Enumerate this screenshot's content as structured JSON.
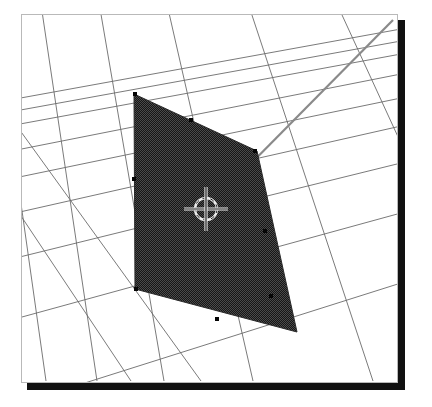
{
  "app": {
    "title": "3D Viewport",
    "view_mode": "Perspective",
    "shading": "Solid"
  },
  "viewport": {
    "name": "3d-viewport",
    "width": 377,
    "height": 369,
    "x": 21,
    "y": 14,
    "background_color": "#ffffff",
    "border_color": "#b9b9b9",
    "shadow_color": "#111111",
    "shadow_offset_x": 6,
    "shadow_offset_y": 6
  },
  "scene": {
    "grid": {
      "name": "perspective-floor-grid",
      "line_color": "#6b6b6b",
      "line_width": 0.9,
      "description": "Perspective ground plane grid with two families of converging lines",
      "family_a_label": "grid-lines-receding",
      "family_b_label": "grid-lines-lateral",
      "family_a": [
        [
          [
            -30,
            132
          ],
          [
            400,
            53
          ]
        ],
        [
          [
            -30,
            158
          ],
          [
            400,
            73
          ]
        ],
        [
          [
            -30,
            186
          ],
          [
            400,
            97
          ]
        ],
        [
          [
            -30,
            222
          ],
          [
            400,
            125
          ]
        ],
        [
          [
            -30,
            268
          ],
          [
            400,
            162
          ]
        ],
        [
          [
            -30,
            330
          ],
          [
            400,
            212
          ]
        ],
        [
          [
            -30,
            418
          ],
          [
            400,
            282
          ]
        ],
        [
          [
            -30,
            118
          ],
          [
            400,
            40
          ]
        ],
        [
          [
            -30,
            106
          ],
          [
            400,
            28
          ]
        ]
      ],
      "family_b": [
        [
          [
            -10,
            -10
          ],
          [
            45,
            380
          ]
        ],
        [
          [
            38,
            -10
          ],
          [
            96,
            380
          ]
        ],
        [
          [
            96,
            -10
          ],
          [
            163,
            380
          ]
        ],
        [
          [
            163,
            -10
          ],
          [
            252,
            380
          ]
        ],
        [
          [
            243,
            -10
          ],
          [
            372,
            380
          ]
        ],
        [
          [
            330,
            -10
          ],
          [
            500,
            360
          ]
        ],
        [
          [
            415,
            -10
          ],
          [
            600,
            330
          ]
        ],
        [
          [
            -60,
            20
          ],
          [
            200,
            380
          ]
        ],
        [
          [
            -60,
            95
          ],
          [
            130,
            380
          ]
        ]
      ]
    },
    "axis_line": {
      "name": "axis-guide-line",
      "color": "#8a8a8a",
      "line_width": 2.2,
      "start": [
        205,
        208
      ],
      "end": [
        392,
        19
      ]
    },
    "selected_face": {
      "name": "selected-quad-face",
      "label": "Plane",
      "fill_color": "#373737",
      "fill_pattern": "dither-50",
      "edge_color": "#2a2a2a",
      "vertices": [
        [
          133,
          93
        ],
        [
          256,
          150
        ],
        [
          296,
          331
        ],
        [
          134,
          288
        ]
      ],
      "vertex_markers": [
        [
          134,
          93
        ],
        [
          190,
          119
        ],
        [
          133,
          178
        ],
        [
          254,
          150
        ],
        [
          264,
          230
        ],
        [
          270,
          295
        ],
        [
          216,
          318
        ],
        [
          135,
          288
        ]
      ]
    },
    "cursor_3d": {
      "name": "3d-cursor",
      "position": [
        205,
        208
      ],
      "radius": 11,
      "color_light": "#ededed",
      "color_dark": "#1c1c1c",
      "crosshair_extent": 22
    }
  }
}
